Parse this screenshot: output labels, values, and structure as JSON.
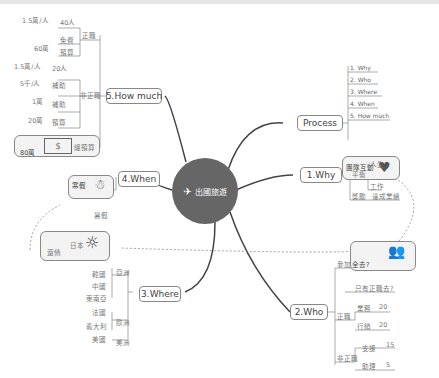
{
  "center": {
    "label": "出國旅遊",
    "icon": "airplane-icon"
  },
  "branches": {
    "process": {
      "label": "Process",
      "items": [
        "1. Why",
        "2. Who",
        "3. Where",
        "4. When",
        "5. How much"
      ]
    },
    "why": {
      "label": "1.Why",
      "card_label": "團隊互動",
      "card_icon": "heart-icon",
      "groups": [
        {
          "label": "平衡",
          "items": [
            "人生",
            "工作"
          ]
        },
        {
          "label": "獎勵",
          "items": [
            "達成業績"
          ]
        }
      ]
    },
    "who": {
      "label": "2.Who",
      "join": {
        "label": "參加",
        "card_label": "全去?",
        "card_icon": "people-icon",
        "sub": "只有正職去?"
      },
      "fulltime": {
        "label": "正職",
        "rows": [
          {
            "k": "業務",
            "v": "20"
          },
          {
            "k": "行銷",
            "v": "20"
          }
        ]
      },
      "parttime": {
        "label": "非正職",
        "rows": [
          {
            "k": "支援",
            "v": "15"
          },
          {
            "k": "助理",
            "v": "5"
          }
        ]
      }
    },
    "where": {
      "label": "3.Where",
      "card_label": "日本",
      "card_side": "還債",
      "card_icon": "sun-icon",
      "regions": [
        {
          "label": "亞洲",
          "items": [
            "韓國",
            "中國",
            "東南亞"
          ]
        },
        {
          "label": "歐洲",
          "items": [
            "法國",
            "義大利"
          ]
        },
        {
          "label": "美洲",
          "items": [
            "美國"
          ]
        }
      ]
    },
    "when": {
      "label": "4.When",
      "card_label": "寒假",
      "card_icon": "snowman-icon",
      "sub": "暑假"
    },
    "howmuch": {
      "label": "5.How much",
      "fulltime": {
        "label": "正職",
        "rows": [
          {
            "k": "40人",
            "v": "1.5萬/人"
          },
          {
            "k": "免費",
            "v": ""
          },
          {
            "k": "預算",
            "v": "60萬"
          }
        ]
      },
      "parttime": {
        "label": "非正職",
        "rows": [
          {
            "k": "20人",
            "v": "1.5萬/人"
          },
          {
            "k": "補助",
            "v": "5千/人"
          },
          {
            "k": "補助",
            "v": "1萬"
          },
          {
            "k": "預算",
            "v": "20萬"
          }
        ]
      },
      "total": {
        "label": "總預算",
        "value": "80萬",
        "icon": "money-icon"
      }
    }
  }
}
